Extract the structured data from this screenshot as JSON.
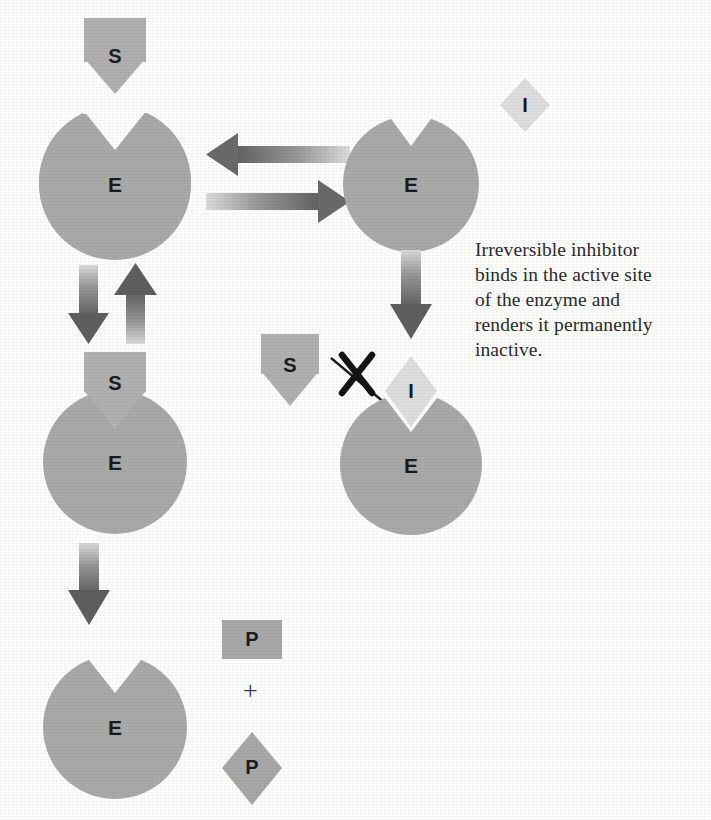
{
  "diagram": {
    "colors": {
      "enzyme_fill": "#a9a9a9",
      "substrate_fill": "#b0b0b0",
      "product_fill": "#a8a8a8",
      "inhibitor_fill": "#dedede",
      "arrow_dark": "#6a6a6a",
      "arrow_light": "#d8d8d8",
      "text": "#1b1b1b",
      "background": "#fdfdfc"
    },
    "caption": {
      "text": "Irreversible inhibitor binds in the active site of the enzyme and renders it permanently inactive.",
      "lines": [
        "Irreversible inhibitor",
        "binds in the active site",
        "of the enzyme and",
        "renders it permanently",
        "inactive."
      ]
    },
    "labels": {
      "substrate": "S",
      "enzyme": "E",
      "inhibitor": "I",
      "product": "P",
      "plus": "+"
    },
    "nodes": [
      {
        "id": "substrate-top",
        "label": "S",
        "shape": "rect-diamond"
      },
      {
        "id": "enzyme-free-left",
        "label": "E",
        "shape": "notched-circle"
      },
      {
        "id": "enzyme-free-right",
        "label": "E",
        "shape": "notched-circle"
      },
      {
        "id": "inhibitor-free",
        "label": "I",
        "shape": "diamond"
      },
      {
        "id": "enzyme-substrate-complex",
        "label": "E",
        "shape": "notched-circle"
      },
      {
        "id": "substrate-bound",
        "label": "S",
        "shape": "rect-diamond"
      },
      {
        "id": "substrate-blocked",
        "label": "S",
        "shape": "rect-diamond"
      },
      {
        "id": "enzyme-inhibited",
        "label": "E",
        "shape": "notched-circle"
      },
      {
        "id": "inhibitor-bound",
        "label": "I",
        "shape": "diamond"
      },
      {
        "id": "enzyme-regenerated",
        "label": "E",
        "shape": "notched-circle"
      },
      {
        "id": "product-rect",
        "label": "P",
        "shape": "rect"
      },
      {
        "id": "product-diamond",
        "label": "P",
        "shape": "diamond"
      }
    ],
    "arrows": [
      {
        "id": "substrate-entry-arrow",
        "direction": "down",
        "style": "gradient"
      },
      {
        "id": "reversible-arrow-left",
        "direction": "left",
        "style": "gradient"
      },
      {
        "id": "reversible-arrow-right",
        "direction": "right",
        "style": "gradient"
      },
      {
        "id": "complex-form-arrow",
        "direction": "down",
        "style": "gradient"
      },
      {
        "id": "complex-reverse-arrow",
        "direction": "up",
        "style": "gradient"
      },
      {
        "id": "inhibition-arrow",
        "direction": "down",
        "style": "gradient"
      },
      {
        "id": "product-release-arrow",
        "direction": "down",
        "style": "gradient"
      },
      {
        "id": "blocked-binding-arrow",
        "direction": "diagonal",
        "style": "thin-crossed"
      }
    ],
    "annotations": [
      {
        "id": "blocking-x-mark",
        "symbol": "X",
        "meaning": "binding prevented"
      }
    ]
  }
}
